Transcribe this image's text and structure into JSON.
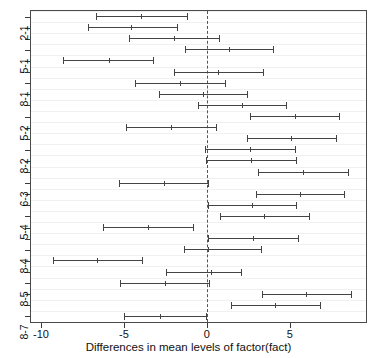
{
  "chart_data": {
    "type": "errorbar",
    "title": "",
    "xlabel": "Differences in mean levels of factor(fact)",
    "ylabel": "",
    "xlim": [
      -10.6,
      9.6
    ],
    "xticks": [
      -10,
      -5,
      0,
      5
    ],
    "xticklabels": [
      "-10",
      "-5",
      "0",
      "5"
    ],
    "reference_line": 0,
    "reference_line_style": "dashed",
    "grid": "horizontal",
    "ytick_labels": [
      "2-1",
      "5-1",
      "8-1",
      "5-2",
      "8-2",
      "6-3",
      "5-4",
      "8-4",
      "8-5",
      "8-7"
    ],
    "comparisons": [
      {
        "label": "2-1",
        "lower": -6.7,
        "diff": -3.95,
        "upper": -1.18
      },
      {
        "label": "3-1",
        "lower": -7.18,
        "diff": -4.55,
        "upper": -1.8
      },
      {
        "label": "4-1",
        "lower": -4.7,
        "diff": -2.0,
        "upper": 0.72
      },
      {
        "label": "5-1",
        "lower": -1.32,
        "diff": 1.35,
        "upper": 4.0
      },
      {
        "label": "6-1",
        "lower": -8.7,
        "diff": -5.9,
        "upper": -3.25
      },
      {
        "label": "7-1",
        "lower": -1.95,
        "diff": 0.7,
        "upper": 3.4
      },
      {
        "label": "8-1",
        "lower": -4.3,
        "diff": -1.6,
        "upper": 1.1
      },
      {
        "label": "3-2",
        "lower": -2.9,
        "diff": -0.2,
        "upper": 2.45
      },
      {
        "label": "4-2",
        "lower": -0.55,
        "diff": 2.1,
        "upper": 4.8
      },
      {
        "label": "5-2",
        "lower": 2.6,
        "diff": 5.3,
        "upper": 8.0
      },
      {
        "label": "6-2",
        "lower": -4.85,
        "diff": -2.15,
        "upper": 0.55
      },
      {
        "label": "7-2",
        "lower": 2.45,
        "diff": 5.1,
        "upper": 7.8
      },
      {
        "label": "8-2",
        "lower": -0.1,
        "diff": 2.6,
        "upper": 5.3
      },
      {
        "label": "4-3",
        "lower": -0.05,
        "diff": 2.65,
        "upper": 5.35
      },
      {
        "label": "5-3",
        "lower": 3.1,
        "diff": 5.8,
        "upper": 8.5
      },
      {
        "label": "6-3",
        "lower": -5.3,
        "diff": -2.6,
        "upper": 0.1
      },
      {
        "label": "7-3",
        "lower": 2.95,
        "diff": 5.6,
        "upper": 8.3
      },
      {
        "label": "8-3",
        "lower": 0.05,
        "diff": 2.7,
        "upper": 5.4
      },
      {
        "label": "5-4",
        "lower": 0.8,
        "diff": 3.45,
        "upper": 6.15
      },
      {
        "label": "6-4",
        "lower": -6.25,
        "diff": -3.55,
        "upper": -0.85
      },
      {
        "label": "7-4",
        "lower": 0.1,
        "diff": 2.8,
        "upper": 5.5
      },
      {
        "label": "8-4",
        "lower": -1.35,
        "diff": 0.1,
        "upper": 3.25
      },
      {
        "label": "6-5",
        "lower": -9.25,
        "diff": -6.6,
        "upper": -3.9
      },
      {
        "label": "7-5",
        "lower": -2.45,
        "diff": 0.25,
        "upper": 2.05
      },
      {
        "label": "8-5",
        "lower": -5.25,
        "diff": -2.55,
        "upper": 0.15
      },
      {
        "label": "7-6",
        "lower": 3.3,
        "diff": 6.0,
        "upper": 8.7
      },
      {
        "label": "8-6",
        "lower": 1.45,
        "diff": 4.1,
        "upper": 6.8
      },
      {
        "label": "8-7",
        "lower": -5.0,
        "diff": -2.8,
        "upper": -0.05
      }
    ]
  },
  "axis": {
    "x_title": "Differences in mean levels of factor(fact)",
    "x_tick_labels": [
      "-10",
      "-5",
      "0",
      "5"
    ],
    "y_tick_labels": [
      "2-1",
      "5-1",
      "8-1",
      "5-2",
      "8-2",
      "6-3",
      "5-4",
      "8-4",
      "8-5",
      "8-7"
    ]
  },
  "colors": {
    "line": "#444444",
    "grid": "#f0f0f0",
    "frame": "#4a4a4a",
    "reference": "#555555",
    "text": "#111111"
  }
}
